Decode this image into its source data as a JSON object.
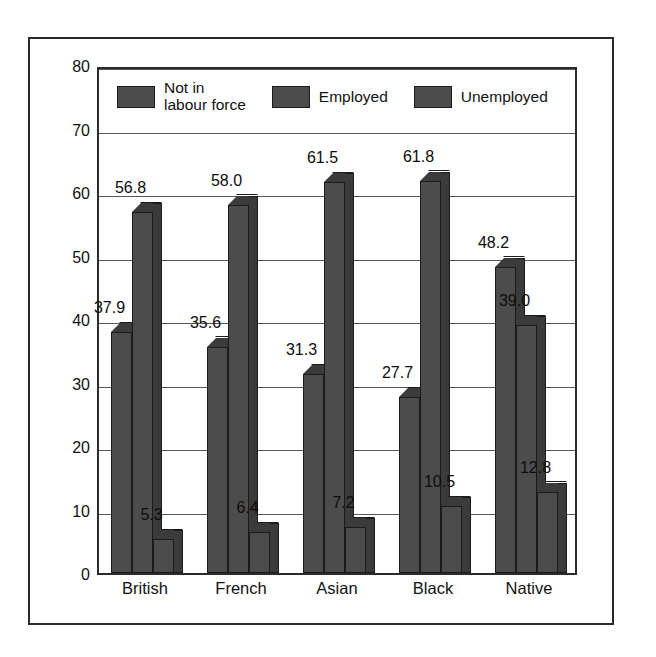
{
  "chart_data": {
    "type": "bar",
    "title": "",
    "subtitle": "",
    "xlabel": "",
    "ylabel": "Percentage",
    "ylim": [
      0,
      80
    ],
    "ytick_step": 10,
    "yticks": [
      "80",
      "70",
      "60",
      "50",
      "40",
      "30",
      "20",
      "10",
      "0"
    ],
    "grid": true,
    "legend_position": "inside-top-left",
    "categories": [
      "British",
      "French",
      "Asian",
      "Black",
      "Native"
    ],
    "series": [
      {
        "name": "Not in\nlabour force",
        "values": [
          37.9,
          35.6,
          31.3,
          27.7,
          48.2
        ],
        "labels": [
          "37.9",
          "35.6",
          "31.3",
          "27.7",
          "48.2"
        ]
      },
      {
        "name": "Employed",
        "values": [
          56.8,
          58.0,
          61.5,
          61.8,
          39.0
        ],
        "labels": [
          "56.8",
          "58.0",
          "61.5",
          "61.8",
          "39.0"
        ]
      },
      {
        "name": "Unemployed",
        "values": [
          5.3,
          6.4,
          7.2,
          10.5,
          12.8
        ],
        "labels": [
          "5.3",
          "6.4",
          "7.2",
          "10.5",
          "12.8"
        ]
      }
    ],
    "colors": {
      "bar_face": "#4c4c4c",
      "bar_shade": "#3b3b3b",
      "bar_outline": "#1b1b1b",
      "gridline": "#55585c",
      "frame": "#2b2b2b",
      "background": "#ffffff",
      "text": "#111111"
    }
  },
  "legend": {
    "entries": [
      {
        "label": "Not in\nlabour force",
        "swatch": "legend-swatch-not-in-labour-force"
      },
      {
        "label": "Employed",
        "swatch": "legend-swatch-employed"
      },
      {
        "label": "Unemployed",
        "swatch": "legend-swatch-unemployed"
      }
    ]
  },
  "axes": {
    "y_title": "Percentage",
    "y_ticks": [
      "80",
      "70",
      "60",
      "50",
      "40",
      "30",
      "20",
      "10",
      "0"
    ],
    "x_ticks": [
      "British",
      "French",
      "Asian",
      "Black",
      "Native"
    ]
  }
}
